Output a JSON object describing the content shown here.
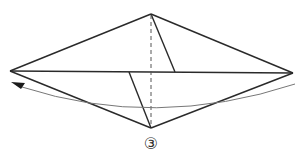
{
  "diagram": {
    "type": "origami-fold-step",
    "step_label": "③",
    "colors": {
      "line": "#2a2a2a",
      "dashed": "#555555",
      "arrow": "#777777",
      "background": "#ffffff"
    },
    "vertices": {
      "top": [
        151,
        14
      ],
      "left": [
        10,
        71
      ],
      "right": [
        293,
        73
      ],
      "bottom": [
        151,
        128
      ]
    },
    "lines": [
      {
        "name": "outline-top-left",
        "from": [
          10,
          71
        ],
        "to": [
          151,
          14
        ],
        "style": "solid"
      },
      {
        "name": "outline-top-right",
        "from": [
          151,
          14
        ],
        "to": [
          293,
          73
        ],
        "style": "solid"
      },
      {
        "name": "outline-bottom-left",
        "from": [
          10,
          71
        ],
        "to": [
          151,
          128
        ],
        "style": "solid"
      },
      {
        "name": "outline-bottom-right",
        "from": [
          151,
          128
        ],
        "to": [
          293,
          73
        ],
        "style": "solid"
      },
      {
        "name": "horizontal-crease",
        "from": [
          10,
          71
        ],
        "to": [
          293,
          73
        ],
        "style": "solid"
      },
      {
        "name": "center-fold-line",
        "from": [
          151,
          14
        ],
        "to": [
          151,
          128
        ],
        "style": "dashed"
      },
      {
        "name": "upper-flap-edge",
        "from": [
          151,
          14
        ],
        "to": [
          175,
          72
        ],
        "style": "solid"
      },
      {
        "name": "lower-flap-edge",
        "from": [
          129,
          72
        ],
        "to": [
          151,
          128
        ],
        "style": "solid"
      }
    ],
    "arrow": {
      "name": "fold-direction-arrow",
      "direction": "right-to-left",
      "start": [
        295,
        84
      ],
      "end": [
        14,
        84
      ]
    }
  }
}
